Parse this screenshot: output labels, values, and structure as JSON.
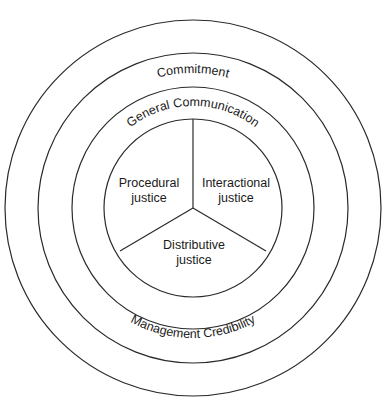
{
  "diagram": {
    "rings": [
      {
        "id": "commitment",
        "label": "Commitment",
        "label_position": "top"
      },
      {
        "id": "management-credibility",
        "label": "Management Credibility",
        "label_position": "bottom"
      },
      {
        "id": "general-communication",
        "label": "General Communication",
        "label_position": "top"
      }
    ],
    "core": {
      "segments": [
        {
          "id": "procedural",
          "line1": "Procedural",
          "line2": "justice"
        },
        {
          "id": "interactional",
          "line1": "Interactional",
          "line2": "justice"
        },
        {
          "id": "distributive",
          "line1": "Distributive",
          "line2": "justice"
        }
      ]
    }
  }
}
